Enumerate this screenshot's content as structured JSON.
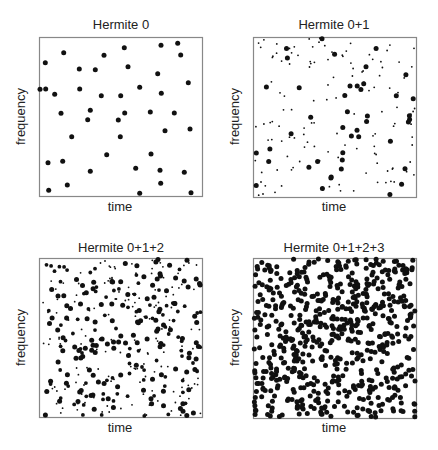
{
  "figure": {
    "panels": [
      {
        "title": "Hermite 0",
        "xlabel": "time",
        "ylabel": "frequency"
      },
      {
        "title": "Hermite 0+1",
        "xlabel": "time",
        "ylabel": "frequency"
      },
      {
        "title": "Hermite 0+1+2",
        "xlabel": "time",
        "ylabel": "frequency"
      },
      {
        "title": "Hermite 0+1+2+3",
        "xlabel": "time",
        "ylabel": "frequency"
      }
    ]
  },
  "colors": {
    "dot": "#111111",
    "frame": "#888888",
    "text": "#222222"
  },
  "chart_data": [
    {
      "type": "scatter",
      "title": "Hermite 0",
      "xlabel": "time",
      "ylabel": "frequency",
      "grid": false,
      "box_px": [
        39,
        37,
        202,
        196
      ],
      "marker_sizes": [
        "large"
      ],
      "points_px": [
        [
          177.7,
          43.3
        ],
        [
          161,
          45.3
        ],
        [
          124.3,
          47.7
        ],
        [
          63.7,
          52.7
        ],
        [
          104,
          55.3
        ],
        [
          180.7,
          55
        ],
        [
          45.3,
          62.7
        ],
        [
          79.3,
          69
        ],
        [
          95.3,
          69.7
        ],
        [
          128,
          66.7
        ],
        [
          157.7,
          73.7
        ],
        [
          188.3,
          82.7
        ],
        [
          40,
          89.3
        ],
        [
          45.7,
          89
        ],
        [
          79.7,
          89
        ],
        [
          139.7,
          87.3
        ],
        [
          161.3,
          93.3
        ],
        [
          54.7,
          94.3
        ],
        [
          101.3,
          95.7
        ],
        [
          120.7,
          95.7
        ],
        [
          90.3,
          110.3
        ],
        [
          61,
          113.3
        ],
        [
          124.7,
          113
        ],
        [
          150.3,
          112
        ],
        [
          174.3,
          113
        ],
        [
          87.7,
          119.7
        ],
        [
          118.3,
          120
        ],
        [
          165,
          130.7
        ],
        [
          190,
          129
        ],
        [
          71.7,
          136.7
        ],
        [
          120.3,
          136.7
        ],
        [
          106.7,
          154.7
        ],
        [
          151,
          154
        ],
        [
          48,
          162.7
        ],
        [
          62.7,
          161.3
        ],
        [
          90.3,
          171.3
        ],
        [
          135.7,
          168.3
        ],
        [
          160,
          170.3
        ],
        [
          184.3,
          172.3
        ],
        [
          67.3,
          185
        ],
        [
          160.7,
          183.3
        ],
        [
          48.7,
          190.3
        ],
        [
          139.7,
          193.3
        ],
        [
          191,
          192.7
        ]
      ]
    },
    {
      "type": "scatter",
      "title": "Hermite 0+1",
      "xlabel": "time",
      "ylabel": "frequency",
      "grid": false,
      "box_px": [
        253,
        37,
        416,
        197
      ],
      "marker_sizes": [
        "large",
        "small"
      ],
      "large_count_approx": 44,
      "small_count_approx": 130,
      "seed": 17
    },
    {
      "type": "scatter",
      "title": "Hermite 0+1+2",
      "xlabel": "time",
      "ylabel": "frequency",
      "grid": false,
      "box_px": [
        39,
        258,
        202,
        417
      ],
      "marker_sizes": [
        "large",
        "medium",
        "small"
      ],
      "large_count_approx": 130,
      "medium_count_approx": 90,
      "small_count_approx": 160,
      "seed": 42
    },
    {
      "type": "scatter",
      "title": "Hermite 0+1+2+3",
      "xlabel": "time",
      "ylabel": "frequency",
      "grid": false,
      "box_px": [
        253,
        258,
        416,
        418
      ],
      "marker_sizes": [
        "large"
      ],
      "large_count_approx": 620,
      "seed": 99
    }
  ]
}
